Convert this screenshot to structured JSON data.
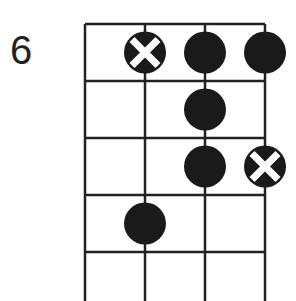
{
  "diagram": {
    "fret_label": "6",
    "strings": 4,
    "frets_shown": 5,
    "dots": [
      {
        "string": 2,
        "fret": 1,
        "type": "x"
      },
      {
        "string": 3,
        "fret": 1,
        "type": "filled"
      },
      {
        "string": 4,
        "fret": 1,
        "type": "filled"
      },
      {
        "string": 3,
        "fret": 2,
        "type": "filled"
      },
      {
        "string": 3,
        "fret": 3,
        "type": "filled"
      },
      {
        "string": 4,
        "fret": 3,
        "type": "x"
      },
      {
        "string": 2,
        "fret": 4,
        "type": "filled"
      }
    ],
    "colors": {
      "line": "#222222",
      "dot": "#1a1a1a"
    }
  }
}
